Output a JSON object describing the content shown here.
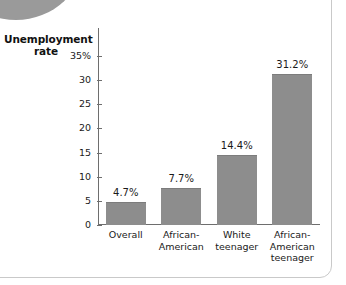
{
  "figure": {
    "width": 346,
    "height": 285,
    "background": "#ffffff",
    "frame_color": "#c9c9c9",
    "corner_blob_color": "#9a9a9a"
  },
  "chart_data": {
    "type": "bar",
    "title": "",
    "ylabel": "Unemployment\nrate",
    "xlabel": "",
    "categories": [
      "Overall",
      "African-\nAmerican",
      "White\nteenager",
      "African-\nAmerican\nteenager"
    ],
    "values": [
      4.7,
      7.7,
      14.4,
      31.2
    ],
    "value_labels": [
      "4.7%",
      "7.7%",
      "14.4%",
      "31.2%"
    ],
    "ylim": [
      0,
      35
    ],
    "yticks": [
      0,
      5,
      10,
      15,
      20,
      25,
      30,
      35
    ],
    "ytick_labels": [
      "0",
      "5",
      "10",
      "15",
      "20",
      "25",
      "30",
      "35%"
    ],
    "grid": false,
    "legend": false,
    "bar_color": "#8d8d8d",
    "axis_color": "#6e6e6e",
    "text_color": "#1a1a1a"
  }
}
